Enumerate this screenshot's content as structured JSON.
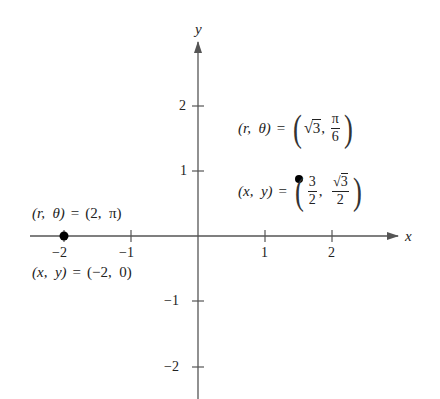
{
  "figure": {
    "x_axis_label": "x",
    "y_axis_label": "y",
    "x_ticks": [
      {
        "value": -2,
        "label": "−2"
      },
      {
        "value": -1,
        "label": "−1"
      },
      {
        "value": 1,
        "label": "1"
      },
      {
        "value": 2,
        "label": "2"
      }
    ],
    "y_ticks": [
      {
        "value": 2,
        "label": "2"
      },
      {
        "value": 1,
        "label": "1"
      },
      {
        "value": -1,
        "label": "−1"
      },
      {
        "value": -2,
        "label": "−2"
      }
    ],
    "points": [
      {
        "name": "point-a",
        "x": -2,
        "y": 0,
        "polar_label": {
          "lhs": "(r,  θ)",
          "eq": "=",
          "rhs": "(2,  π)"
        },
        "rect_label": {
          "lhs": "(x,  y)",
          "eq": "=",
          "rhs": "(−2,  0)"
        }
      },
      {
        "name": "point-b",
        "x": 1.5,
        "y": 0.866,
        "polar_label": {
          "lhs": "(r,  θ)",
          "eq": "=",
          "r_value": "3",
          "r_radical": "√",
          "theta_num": "π",
          "theta_den": "6"
        },
        "rect_label": {
          "lhs": "(x,  y)",
          "eq": "=",
          "x_num": "3",
          "x_den": "2",
          "y_num": "3",
          "y_radical": "√",
          "y_den": "2"
        }
      }
    ],
    "colors": {
      "axis": "#555555",
      "point": "#000000",
      "text": "#222222"
    }
  }
}
